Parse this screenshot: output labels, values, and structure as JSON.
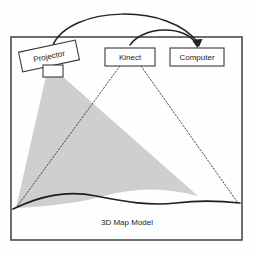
{
  "diagram": {
    "frame": {
      "name": "enclosure-frame",
      "x": 11,
      "y": 37,
      "width": 231,
      "height": 203,
      "stroke_color": "#4a4a4a"
    },
    "nodes": [
      {
        "id": "projector",
        "label": "Projector",
        "shape": "rotated-rectangle",
        "rotation_deg": -12,
        "x": 20,
        "y": 46,
        "width": 58,
        "height": 20,
        "has_lens": true,
        "lens": {
          "x": 43,
          "y": 66,
          "width": 20,
          "height": 11
        }
      },
      {
        "id": "kinect",
        "label": "Kinect",
        "shape": "rectangle",
        "rotation_deg": 0,
        "x": 105,
        "y": 48,
        "width": 50,
        "height": 18,
        "has_lens": false
      },
      {
        "id": "computer",
        "label": "Computer",
        "shape": "rectangle",
        "rotation_deg": 0,
        "x": 170,
        "y": 48,
        "width": 54,
        "height": 18,
        "has_lens": false
      }
    ],
    "connectors": [
      {
        "id": "projector-to-computer",
        "from": "projector",
        "to": "computer",
        "style": "solid-arc",
        "arc_height": "large",
        "color": "#232323"
      },
      {
        "id": "kinect-to-computer",
        "from": "kinect",
        "to": "computer",
        "style": "solid-arc",
        "arc_height": "small",
        "color": "#232323"
      }
    ],
    "projection_cone": {
      "name": "projector-light-cone",
      "source": "projector",
      "target": "terrain",
      "fill_color": "#c8c8c8",
      "opacity": 0.85
    },
    "sensing_rays": [
      {
        "id": "kinect-ray-left",
        "from": "kinect",
        "to": "terrain-left",
        "style": "dotted"
      },
      {
        "id": "kinect-ray-right",
        "from": "kinect",
        "to": "terrain-right",
        "style": "dotted"
      }
    ],
    "terrain": {
      "name": "terrain-surface",
      "label": "3D Map Model",
      "curve": "wavy",
      "left_y": 208,
      "right_y": 203,
      "stroke_color": "#1f1f1f"
    }
  }
}
